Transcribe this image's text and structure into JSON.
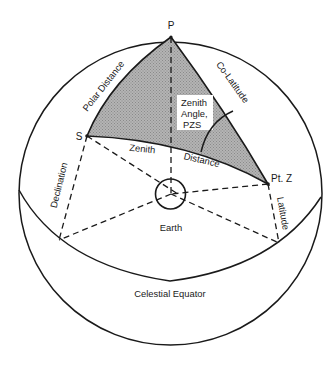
{
  "figure": {
    "type": "celestial-sphere-navigational-triangle",
    "colors": {
      "line": "#1a1a1a",
      "triangle_fill": "#a9a9a9",
      "background": "#ffffff",
      "label_box": "#ffffff"
    }
  },
  "points": {
    "pole": {
      "label": "P"
    },
    "star": {
      "label": "S"
    },
    "zenith_point": {
      "label": "Pt. Z"
    }
  },
  "labels": {
    "polar_distance": "Polar Distance",
    "co_latitude": "Co-Latitude",
    "zenith_angle_line1": "Zenith",
    "zenith_angle_line2": "Angle,",
    "zenith_angle_line3": "PZS",
    "zenith_distance_part1": "Zenith",
    "zenith_distance_part2": "Distance",
    "declination": "Declination",
    "latitude": "Latitude",
    "earth": "Earth",
    "celestial_equator": "Celestial Equator"
  }
}
